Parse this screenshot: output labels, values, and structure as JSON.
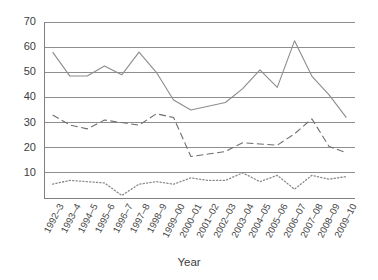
{
  "chart_data": {
    "type": "line",
    "title": "",
    "xlabel": "Year",
    "ylabel": "",
    "ylim": [
      0,
      70
    ],
    "ytick_values": [
      10,
      20,
      30,
      40,
      50,
      60,
      70
    ],
    "grid": true,
    "legend": "none",
    "categories": [
      "1992–3",
      "1993–4",
      "1994–5",
      "1995–6",
      "1996–7",
      "1997–8",
      "1998–9",
      "1999–00",
      "2000–01",
      "2001–02",
      "2002–03",
      "2003–04",
      "2004–05",
      "2005–06",
      "2006–07",
      "2007–08",
      "2008–09",
      "2009–10"
    ],
    "series": [
      {
        "name": "series-solid",
        "style": "solid",
        "color": "#8c8c8c",
        "values": [
          58,
          48.5,
          48.5,
          52.5,
          49,
          58,
          50,
          39,
          35,
          36.5,
          38,
          43.5,
          51,
          44,
          62.5,
          48.5,
          41,
          32
        ]
      },
      {
        "name": "series-dashed",
        "style": "dashed",
        "color": "#6e6e6e",
        "values": [
          33,
          29,
          27.5,
          31,
          30,
          29,
          33.5,
          32,
          16.5,
          17.5,
          18.5,
          22,
          21.5,
          21,
          25.5,
          31.5,
          20.5,
          18
        ]
      },
      {
        "name": "series-dotted",
        "style": "dotted",
        "color": "#8a8a8a",
        "values": [
          5.5,
          7,
          6.5,
          6,
          1,
          5.5,
          6.5,
          5.5,
          8,
          7,
          7,
          10,
          6.5,
          9,
          3.5,
          9,
          7.5,
          8.5
        ]
      }
    ],
    "axis_color": "#808080",
    "grid_color": "#8e8e8e",
    "dotted_extra_points": {
      "note": "dotted series rendered with sub-year interpolation markers",
      "tail_value": 1
    }
  }
}
